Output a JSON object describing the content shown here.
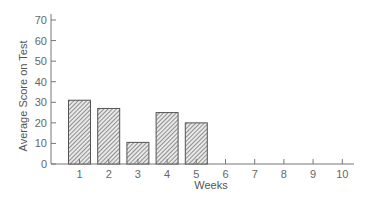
{
  "chart_data": {
    "type": "bar",
    "title": "",
    "xlabel": "Weeks",
    "ylabel": "Average Score on Test",
    "categories": [
      "1",
      "2",
      "3",
      "4",
      "5",
      "6",
      "7",
      "8",
      "9",
      "10"
    ],
    "values": [
      31,
      27,
      10.5,
      25,
      20,
      null,
      null,
      null,
      null,
      null
    ],
    "ylim": [
      0,
      70
    ],
    "yticks": [
      0,
      10,
      20,
      30,
      40,
      50,
      60,
      70
    ],
    "grid": false,
    "legend": null,
    "bar_fill": "hatched",
    "colors": {
      "axis": "#777777",
      "bar_stroke": "#555555",
      "hatch": "#666666",
      "text": "#555555"
    }
  }
}
